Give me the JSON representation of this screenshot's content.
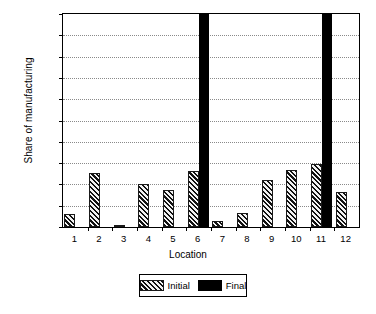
{
  "chart_data": {
    "type": "bar",
    "title": "",
    "xlabel": "Location",
    "ylabel": "Share of manufacturing",
    "categories": [
      "1",
      "2",
      "3",
      "4",
      "5",
      "6",
      "7",
      "8",
      "9",
      "10",
      "11",
      "12"
    ],
    "ylim": [
      0.0,
      0.5
    ],
    "ytick_step": 0.05,
    "ytick_labels": [
      "0.00",
      "0.05",
      "0.10",
      "0.15",
      "0.20",
      "0.25",
      "0.30",
      "0.35",
      "0.40",
      "0.45",
      "0.50"
    ],
    "ytick_values": [
      0.0,
      0.05,
      0.1,
      0.15,
      0.2,
      0.25,
      0.3,
      0.35,
      0.4,
      0.45,
      0.5
    ],
    "grid": true,
    "legend_position": "bottom-center",
    "series": [
      {
        "name": "Initial",
        "style": "hatched-diagonal",
        "color": "#6e6e6e",
        "values": [
          0.03,
          0.127,
          0.003,
          0.1,
          0.086,
          0.132,
          0.014,
          0.032,
          0.11,
          0.134,
          0.148,
          0.083
        ]
      },
      {
        "name": "Final",
        "style": "solid-black",
        "color": "#000000",
        "values": [
          0,
          0,
          0,
          0,
          0,
          0.5,
          0,
          0,
          0,
          0,
          0.5,
          0
        ],
        "clipped_at_axis_max": [
          6,
          11
        ]
      }
    ]
  }
}
